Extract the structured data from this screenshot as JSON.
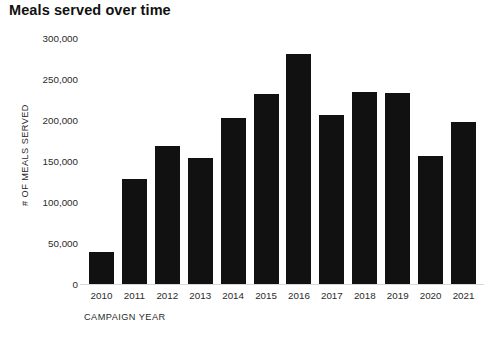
{
  "chart_data": {
    "type": "bar",
    "title": "Meals served over time",
    "xlabel": "CAMPAIGN YEAR",
    "ylabel": "# OF MEALS SERVED",
    "categories": [
      "2010",
      "2011",
      "2012",
      "2013",
      "2014",
      "2015",
      "2016",
      "2017",
      "2018",
      "2019",
      "2020",
      "2021"
    ],
    "values": [
      39000,
      128000,
      168000,
      154000,
      203000,
      232000,
      280000,
      206000,
      234000,
      233000,
      156000,
      198000
    ],
    "ylim": [
      0,
      300000
    ],
    "ytick_values": [
      0,
      50000,
      100000,
      150000,
      200000,
      250000,
      300000
    ],
    "ytick_labels": [
      "0",
      "50,000",
      "100,000",
      "150,000",
      "200,000",
      "250,000",
      "300,000"
    ],
    "grid": false,
    "legend": null,
    "bar_color": "#111111",
    "background_color": "#ffffff",
    "text_color": "#1a1a1a"
  }
}
